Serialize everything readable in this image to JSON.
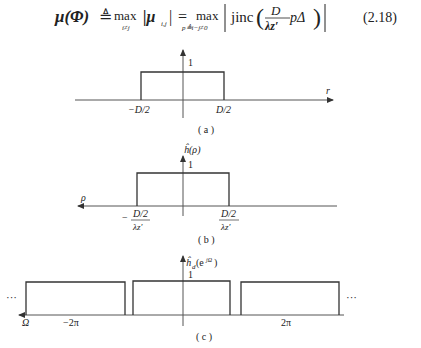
{
  "equation": {
    "lhs": "μ(Φ)",
    "defined_as": "≜",
    "op1": "max",
    "op1_sub": "i≠j",
    "term1": "|μ",
    "term1_sub": "i,j",
    "term1_end": "|",
    "equals": "=",
    "op2": "max",
    "op2_sub": "p≜i−j≠0",
    "jinc": "jinc",
    "frac_num": "D",
    "frac_den": "λz′",
    "after_frac": "pΔ",
    "number": "(2.18)"
  },
  "figures": [
    {
      "id": "a",
      "caption": "( a )",
      "y_tick": "1",
      "x_label": "r",
      "ticks": [
        "−D/2",
        "D/2"
      ],
      "arrow": "right"
    },
    {
      "id": "b",
      "caption": "( b )",
      "y_label": "ĥ(ρ)",
      "y_tick": "1",
      "x_label": "ρ",
      "tick_left": {
        "sign": "−",
        "num": "D/2",
        "den": "λz′"
      },
      "tick_right": {
        "num": "D/2",
        "den": "λz′"
      },
      "arrow": "left"
    },
    {
      "id": "c",
      "caption": "( c )",
      "y_label": "ĥd(e^jΩ)",
      "y_label_main": "ĥ",
      "y_label_sub": "d",
      "y_label_arg": "(e",
      "y_label_sup": "jΩ",
      "y_label_close": ")",
      "y_tick": "1",
      "x_label": "Ω",
      "ticks": [
        "−2π",
        "2π"
      ],
      "ellipsis_left": "···",
      "ellipsis_right": "···",
      "arrow": "left"
    }
  ]
}
